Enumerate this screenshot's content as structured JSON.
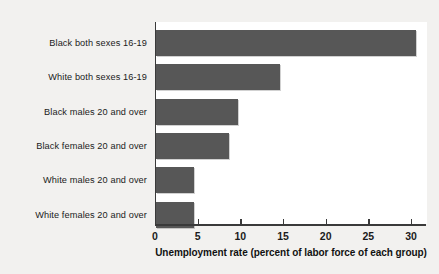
{
  "chart_data": {
    "type": "bar",
    "orientation": "horizontal",
    "title": "",
    "xlabel": "Unemployment rate (percent of labor force of each group)",
    "ylabel": "",
    "categories": [
      "Black both sexes 16-19",
      "White both sexes 16-19",
      "Black males 20 and over",
      "Black females 20 and over",
      "White males 20 and over",
      "White females 20 and over"
    ],
    "values": [
      30.5,
      14.5,
      9.6,
      8.5,
      4.5,
      4.5
    ],
    "xlim": [
      0,
      31.7
    ],
    "xticks": [
      0,
      5,
      10,
      15,
      20,
      25,
      30
    ],
    "xtick_labels": [
      "0",
      "5",
      "10",
      "15",
      "20",
      "25",
      "30"
    ],
    "grid": false,
    "legend": false,
    "bar_color": "#575757",
    "axis_color": "#3a3a3a",
    "plot_background": "#ffffff",
    "figure_background": "#f2f1ef"
  }
}
